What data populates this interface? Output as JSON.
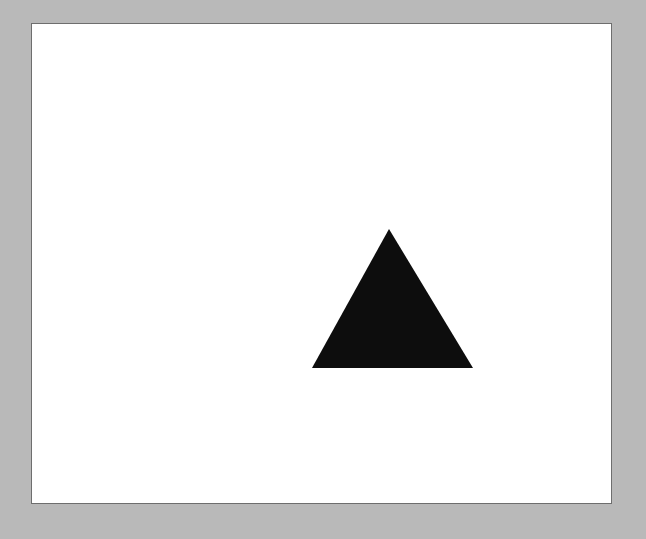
{
  "page": {
    "background_color": "#b9b9b9"
  },
  "canvas": {
    "background_color": "#ffffff",
    "border_color": "#6e6e6e"
  },
  "shapes": [
    {
      "type": "triangle",
      "fill": "#0d0d0d",
      "points": [
        [
          389,
          229
        ],
        [
          312,
          368
        ],
        [
          473,
          368
        ]
      ]
    }
  ]
}
